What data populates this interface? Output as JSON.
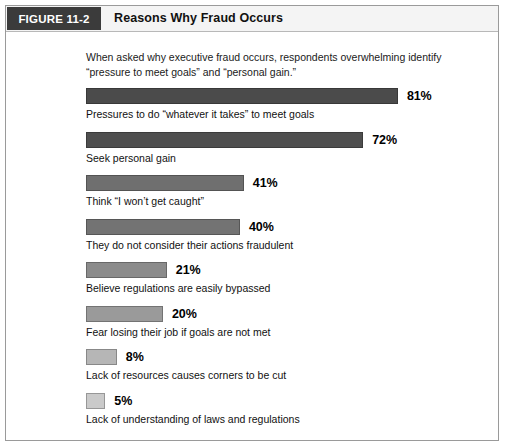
{
  "figure": {
    "tag": "FIGURE 11-2",
    "title": "Reasons Why Fraud Occurs",
    "subtitle": "When asked why executive fraud occurs, respondents overwhelming identify “pressure to meet goals” and “personal gain.”"
  },
  "chart_data": {
    "type": "bar",
    "orientation": "horizontal",
    "title": "Reasons Why Fraud Occurs",
    "subtitle": "When asked why executive fraud occurs, respondents overwhelming identify “pressure to meet goals” and “personal gain.”",
    "xlabel": "",
    "ylabel": "",
    "xlim": [
      0,
      100
    ],
    "grid": false,
    "legend": false,
    "unit": "%",
    "categories": [
      "Pressures to do “whatever it takes” to meet goals",
      "Seek personal gain",
      "Think “I won’t get caught”",
      "They do not consider their actions fraudulent",
      "Believe regulations are easily bypassed",
      "Fear losing their job if goals are not met",
      "Lack of resources causes corners to be cut",
      "Lack of understanding of laws and regulations"
    ],
    "values": [
      81,
      72,
      41,
      40,
      21,
      20,
      8,
      5
    ],
    "value_labels": [
      "81%",
      "72%",
      "41%",
      "40%",
      "21%",
      "20%",
      "8%",
      "5%"
    ],
    "bar_colors": [
      "#4b4b4b",
      "#4f4f4f",
      "#6f6f6f",
      "#737373",
      "#8b8b8b",
      "#9a9a9a",
      "#b6b6b6",
      "#cacaca"
    ],
    "bars": [
      {
        "label": "Pressures to do “whatever it takes” to meet goals",
        "value": 81,
        "value_label": "81%",
        "color": "#4b4b4b"
      },
      {
        "label": "Seek personal gain",
        "value": 72,
        "value_label": "72%",
        "color": "#4f4f4f"
      },
      {
        "label": "Think “I won’t get caught”",
        "value": 41,
        "value_label": "41%",
        "color": "#6f6f6f"
      },
      {
        "label": "They do not consider their actions fraudulent",
        "value": 40,
        "value_label": "40%",
        "color": "#737373"
      },
      {
        "label": "Believe regulations are easily bypassed",
        "value": 21,
        "value_label": "21%",
        "color": "#8b8b8b"
      },
      {
        "label": "Fear losing their job if goals are not met",
        "value": 20,
        "value_label": "20%",
        "color": "#9a9a9a"
      },
      {
        "label": "Lack of resources causes corners to be cut",
        "value": 8,
        "value_label": "8%",
        "color": "#b6b6b6"
      },
      {
        "label": "Lack of understanding of laws and regulations",
        "value": 5,
        "value_label": "5%",
        "color": "#cacaca"
      }
    ]
  },
  "layout": {
    "bar_full_width_px": 385
  }
}
